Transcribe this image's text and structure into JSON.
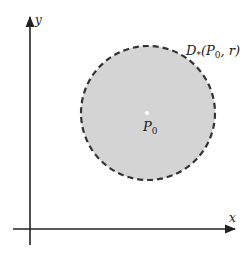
{
  "diagram": {
    "x_axis_label": "x",
    "y_axis_label": "y",
    "region_label": {
      "main": "D",
      "subscript": "*",
      "args_open": "(P",
      "args_sub": "0",
      "args_rest": ", r)"
    },
    "center_label": {
      "main": "P",
      "subscript": "0"
    },
    "region_style": {
      "fill": "#d4d4d4",
      "stroke": "#333333",
      "stroke_style": "dashed"
    }
  }
}
